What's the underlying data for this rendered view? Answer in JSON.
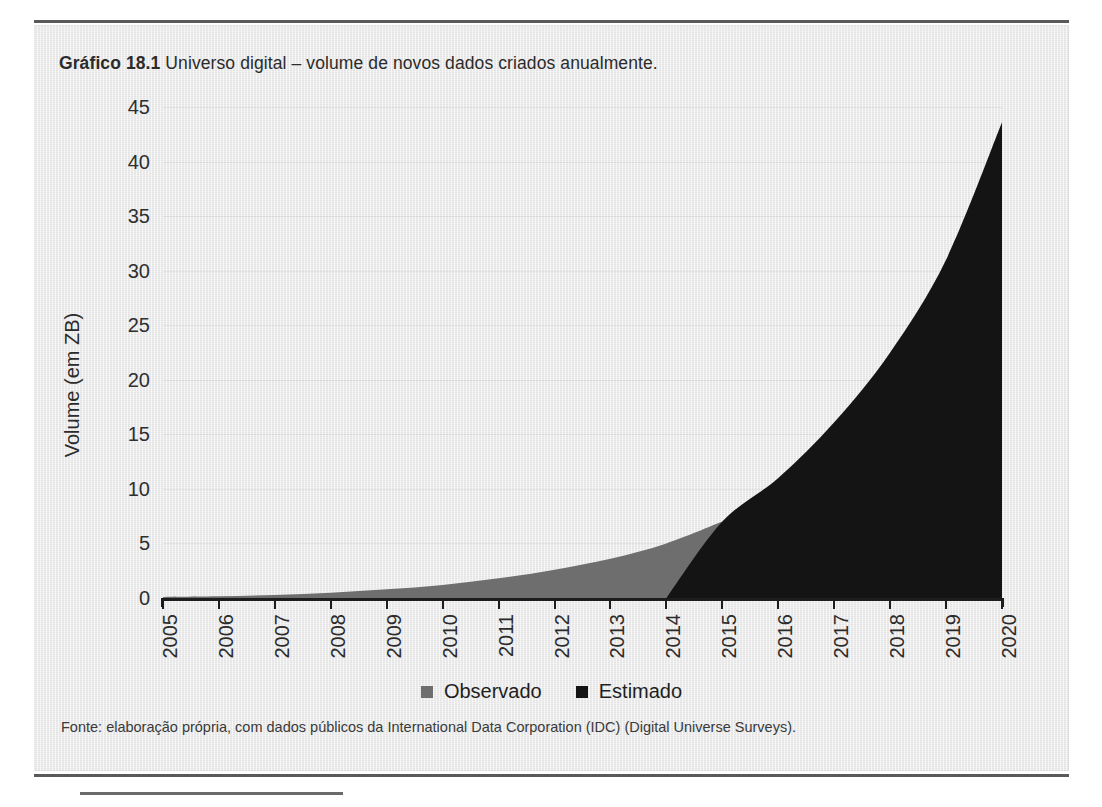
{
  "figure": {
    "title_label": "Gráfico 18.1",
    "title_text": " Universo digital – volume de novos dados criados anualmente.",
    "source": "Fonte: elaboração própria, com dados públicos da International Data Corporation (IDC) (Digital Universe Surveys)."
  },
  "colors": {
    "observado": "#6e6e6e",
    "estimado": "#141414",
    "axis": "#1d1d1d",
    "panel": "#e9e9e9",
    "text": "#2b2b2b"
  },
  "legend": {
    "position": "bottom-center",
    "items": [
      {
        "label": "Observado",
        "color": "#6e6e6e",
        "swatch": "square-swatch"
      },
      {
        "label": "Estimado",
        "color": "#141414",
        "swatch": "square-swatch"
      }
    ]
  },
  "chart_data": {
    "type": "area",
    "title": "Gráfico 18.1 Universo digital – volume de novos dados criados anualmente.",
    "xlabel": "",
    "ylabel": "Volume (em ZB)",
    "x": [
      2005,
      2006,
      2007,
      2008,
      2009,
      2010,
      2011,
      2012,
      2013,
      2014,
      2015,
      2016,
      2017,
      2018,
      2019,
      2020
    ],
    "xtick_labels": [
      "2005",
      "2006",
      "2007",
      "2008",
      "2009",
      "2010",
      "2011",
      "2012",
      "2013",
      "2014",
      "2015",
      "2016",
      "2017",
      "2018",
      "2019",
      "2020"
    ],
    "ytick_labels": [
      "0",
      "5",
      "10",
      "15",
      "20",
      "25",
      "30",
      "35",
      "40",
      "45"
    ],
    "yticks": [
      0,
      5,
      10,
      15,
      20,
      25,
      30,
      35,
      40,
      45
    ],
    "ylim": [
      0,
      45
    ],
    "xlim": [
      2005,
      2020
    ],
    "grid": true,
    "series": [
      {
        "name": "Observado",
        "color": "#6e6e6e",
        "x": [
          2005,
          2006,
          2007,
          2008,
          2009,
          2010,
          2011,
          2012,
          2013,
          2014,
          2015
        ],
        "values": [
          0.1,
          0.16,
          0.28,
          0.49,
          0.8,
          1.2,
          1.8,
          2.6,
          3.6,
          5.0,
          7.0
        ]
      },
      {
        "name": "Estimado",
        "color": "#141414",
        "x": [
          2014,
          2015,
          2016,
          2017,
          2018,
          2019,
          2020
        ],
        "values": [
          0.0,
          7.0,
          11.0,
          16.1,
          22.5,
          31.0,
          43.6
        ]
      }
    ],
    "annotations": []
  }
}
